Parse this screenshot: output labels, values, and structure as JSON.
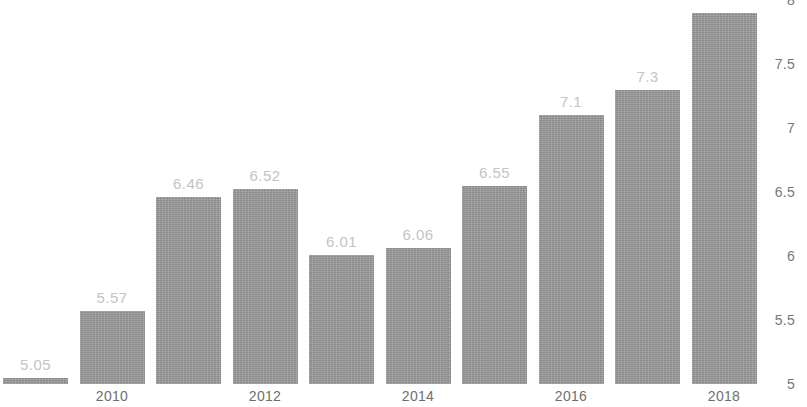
{
  "chart_data": {
    "type": "bar",
    "title": "",
    "subtitle": "",
    "xlabel": "",
    "ylabel": "",
    "categories": [
      "2009",
      "2010",
      "2011",
      "2012",
      "2013",
      "2014",
      "2015",
      "2016",
      "2017",
      "2018"
    ],
    "values": [
      5.05,
      5.57,
      6.46,
      6.52,
      6.01,
      6.06,
      6.55,
      7.1,
      7.3,
      7.9
    ],
    "value_labels": [
      "5.05",
      "5.57",
      "6.46",
      "6.52",
      "6.01",
      "6.06",
      "6.55",
      "7.1",
      "7.3",
      ""
    ],
    "bars": [
      {
        "category": "2009",
        "value": 5.05,
        "label": "5.05",
        "label_visible": true
      },
      {
        "category": "2010",
        "value": 5.57,
        "label": "5.57",
        "label_visible": true
      },
      {
        "category": "2011",
        "value": 6.46,
        "label": "6.46",
        "label_visible": true
      },
      {
        "category": "2012",
        "value": 6.52,
        "label": "6.52",
        "label_visible": true
      },
      {
        "category": "2013",
        "value": 6.01,
        "label": "6.01",
        "label_visible": true
      },
      {
        "category": "2014",
        "value": 6.06,
        "label": "6.06",
        "label_visible": true
      },
      {
        "category": "2015",
        "value": 6.55,
        "label": "6.55",
        "label_visible": true
      },
      {
        "category": "2016",
        "value": 7.1,
        "label": "7.1",
        "label_visible": true
      },
      {
        "category": "2017",
        "value": 7.3,
        "label": "7.3",
        "label_visible": true
      },
      {
        "category": "2018",
        "value": 7.9,
        "label": "",
        "label_visible": false
      }
    ],
    "ylim": [
      5,
      8
    ],
    "y_ticks": [
      8,
      7.5,
      7,
      6.5,
      6,
      5.5,
      5
    ],
    "y_tick_labels": [
      "8",
      "7.5",
      "7",
      "6.5",
      "6",
      "5.5",
      "5"
    ],
    "y_axis_position": "right",
    "x_tick_labels": [
      "2010",
      "2012",
      "2014",
      "2016",
      "2018"
    ],
    "x_tick_categories": [
      "2010",
      "2012",
      "2014",
      "2016",
      "2018"
    ],
    "grid": false,
    "legend": null,
    "legend_position": "none",
    "colors": {
      "bar": "#9a9a9a",
      "value_label": "#c4c4c4",
      "x_tick": "#6e6e6e",
      "y_tick": "#777777",
      "background": "#ffffff"
    }
  }
}
